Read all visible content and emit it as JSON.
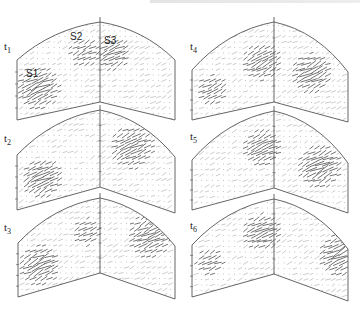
{
  "figure": {
    "colors": {
      "outline": "#555555",
      "arrow": "#444444",
      "dot": "#8a8a8a",
      "background": "#ffffff"
    },
    "source_labels": [
      {
        "text": "S1",
        "x": 26,
        "y": 77
      },
      {
        "text": "S2",
        "x": 70,
        "y": 40
      },
      {
        "text": "S3",
        "x": 104,
        "y": 44
      }
    ],
    "panels": [
      {
        "id": "t1",
        "label": "t",
        "sub": "1",
        "label_x": 4,
        "label_y": 50,
        "x0": 17,
        "xs": 100,
        "x1": 175,
        "top_l": 60,
        "apex": 22,
        "top_r": 60,
        "bot_l": 120,
        "bot_s": 102,
        "bot_r": 120,
        "clusters": [
          {
            "cx": 38,
            "cy": 88,
            "r": 14,
            "s": 1.0
          },
          {
            "cx": 85,
            "cy": 52,
            "r": 10,
            "s": 0.6
          },
          {
            "cx": 113,
            "cy": 53,
            "r": 11,
            "s": 0.9
          }
        ]
      },
      {
        "id": "t2",
        "label": "t",
        "sub": "2",
        "label_x": 4,
        "label_y": 142,
        "x0": 17,
        "xs": 100,
        "x1": 175,
        "top_l": 155,
        "apex": 110,
        "top_r": 157,
        "bot_l": 210,
        "bot_s": 187,
        "bot_r": 213,
        "clusters": [
          {
            "cx": 42,
            "cy": 178,
            "r": 13,
            "s": 1.0
          },
          {
            "cx": 132,
            "cy": 147,
            "r": 14,
            "s": 0.9
          }
        ]
      },
      {
        "id": "t3",
        "label": "t",
        "sub": "3",
        "label_x": 4,
        "label_y": 231,
        "x0": 18,
        "xs": 100,
        "x1": 175,
        "top_l": 243,
        "apex": 198,
        "top_r": 246,
        "bot_l": 297,
        "bot_s": 273,
        "bot_r": 299,
        "clusters": [
          {
            "cx": 40,
            "cy": 265,
            "r": 13,
            "s": 1.0
          },
          {
            "cx": 87,
            "cy": 232,
            "r": 9,
            "s": 0.6
          },
          {
            "cx": 150,
            "cy": 236,
            "r": 14,
            "s": 0.9
          }
        ]
      },
      {
        "id": "t4",
        "label": "t",
        "sub": "4",
        "label_x": 190,
        "label_y": 50,
        "x0": 192,
        "xs": 274,
        "x1": 348,
        "top_l": 70,
        "apex": 22,
        "top_r": 72,
        "bot_l": 120,
        "bot_s": 102,
        "bot_r": 122,
        "clusters": [
          {
            "cx": 212,
            "cy": 90,
            "r": 10,
            "s": 0.7
          },
          {
            "cx": 262,
            "cy": 62,
            "r": 12,
            "s": 0.9
          },
          {
            "cx": 312,
            "cy": 73,
            "r": 13,
            "s": 1.0
          }
        ]
      },
      {
        "id": "t5",
        "label": "t",
        "sub": "5",
        "label_x": 190,
        "label_y": 140,
        "x0": 192,
        "xs": 274,
        "x1": 348,
        "top_l": 160,
        "apex": 111,
        "top_r": 163,
        "bot_l": 210,
        "bot_s": 188,
        "bot_r": 213,
        "clusters": [
          {
            "cx": 262,
            "cy": 148,
            "r": 12,
            "s": 0.9
          },
          {
            "cx": 320,
            "cy": 166,
            "r": 14,
            "s": 1.0
          }
        ]
      },
      {
        "id": "t6",
        "label": "t",
        "sub": "6",
        "label_x": 190,
        "label_y": 229,
        "x0": 192,
        "xs": 274,
        "x1": 348,
        "top_l": 245,
        "apex": 199,
        "top_r": 249,
        "bot_l": 297,
        "bot_s": 274,
        "bot_r": 301,
        "clusters": [
          {
            "cx": 210,
            "cy": 262,
            "r": 9,
            "s": 0.6
          },
          {
            "cx": 262,
            "cy": 232,
            "r": 12,
            "s": 0.9
          },
          {
            "cx": 340,
            "cy": 255,
            "r": 14,
            "s": 1.0
          }
        ]
      }
    ]
  }
}
